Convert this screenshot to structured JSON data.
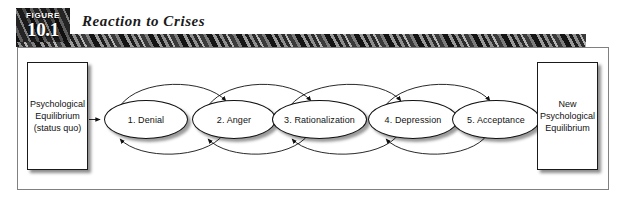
{
  "figure": {
    "badge_word": "FIGURE",
    "badge_number": "10.1",
    "title": "Reaction to Crises"
  },
  "diagram": {
    "start_box": {
      "name": "psychological-equilibrium",
      "text": "Psychological\nEquilibrium\n(status quo)"
    },
    "end_box": {
      "name": "new-psychological-equilibrium",
      "text": "New\nPsychological\nEquilibrium"
    },
    "stages": [
      {
        "label": "1. Denial"
      },
      {
        "label": "2. Anger"
      },
      {
        "label": "3. Rationalization"
      },
      {
        "label": "4. Depression"
      },
      {
        "label": "5. Acceptance"
      }
    ],
    "colors": {
      "frame_border": "#808080",
      "shape_outline": "#111111",
      "badge_background": "#3a3a3a",
      "band_background": "#6d6d6d",
      "text": "#111111",
      "page_background": "#ffffff"
    }
  }
}
